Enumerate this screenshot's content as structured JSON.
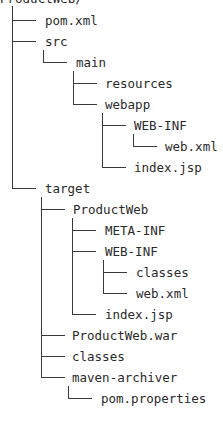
{
  "tree": {
    "root": "ProductWeb/",
    "nodes": [
      {
        "label": "pom.xml",
        "depth": 0,
        "last": false
      },
      {
        "label": "src",
        "depth": 0,
        "last": false
      },
      {
        "label": "main",
        "depth": 1,
        "last": true
      },
      {
        "label": "resources",
        "depth": 2,
        "last": false
      },
      {
        "label": "webapp",
        "depth": 2,
        "last": true
      },
      {
        "label": "WEB-INF",
        "depth": 3,
        "last": false
      },
      {
        "label": "web.xml",
        "depth": 4,
        "last": true
      },
      {
        "label": "index.jsp",
        "depth": 3,
        "last": true
      },
      {
        "label": "target",
        "depth": 0,
        "last": true
      },
      {
        "label": "ProductWeb",
        "depth": 1,
        "last": false
      },
      {
        "label": "META-INF",
        "depth": 2,
        "last": false
      },
      {
        "label": "WEB-INF",
        "depth": 2,
        "last": false
      },
      {
        "label": "classes",
        "depth": 3,
        "last": false
      },
      {
        "label": "web.xml",
        "depth": 3,
        "last": true
      },
      {
        "label": "index.jsp",
        "depth": 2,
        "last": true
      },
      {
        "label": "ProductWeb.war",
        "depth": 1,
        "last": false
      },
      {
        "label": "classes",
        "depth": 1,
        "last": false
      },
      {
        "label": "maven-archiver",
        "depth": 1,
        "last": true
      },
      {
        "label": "pom.properties",
        "depth": 2,
        "last": true
      }
    ]
  },
  "colors": {
    "line": "#3a3a3a",
    "text": "#2a2a2a",
    "background": "#ffffff"
  }
}
